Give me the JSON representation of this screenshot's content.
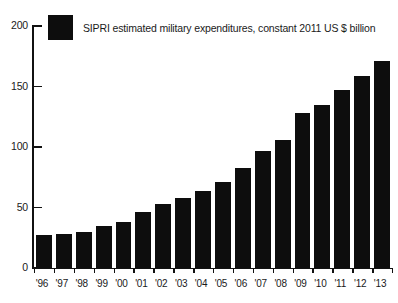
{
  "legend": {
    "label": "SIPRI estimated military expenditures, constant 2011 US $ billion",
    "swatch_color": "#0d0d0d"
  },
  "axis": {
    "y_ticks": [
      "0",
      "50",
      "100",
      "150",
      "200"
    ],
    "x_ticks": [
      "'96",
      "'97",
      "'98",
      "'99",
      "'00",
      "'01",
      "'02",
      "'03",
      "'04",
      "'05",
      "'06",
      "'07",
      "'08",
      "'09",
      "'10",
      "'11",
      "'12",
      "'13"
    ]
  },
  "chart_data": {
    "type": "bar",
    "title": "",
    "subtitle": "",
    "xlabel": "",
    "ylabel": "",
    "ylim": [
      0,
      200
    ],
    "grid": false,
    "legend_position": "top-left",
    "legend_entries": [
      "SIPRI estimated military expenditures, constant 2011 US $ billion"
    ],
    "bar_color": "#0d0d0d",
    "categories": [
      "'96",
      "'97",
      "'98",
      "'99",
      "'00",
      "'01",
      "'02",
      "'03",
      "'04",
      "'05",
      "'06",
      "'07",
      "'08",
      "'09",
      "'10",
      "'11",
      "'12",
      "'13"
    ],
    "values": [
      27,
      28,
      30,
      35,
      38,
      46,
      53,
      58,
      64,
      71,
      83,
      97,
      106,
      128,
      135,
      147,
      159,
      171
    ],
    "series": [
      {
        "name": "SIPRI estimated military expenditures, constant 2011 US $ billion",
        "values": [
          27,
          28,
          30,
          35,
          38,
          46,
          53,
          58,
          64,
          71,
          83,
          97,
          106,
          128,
          135,
          147,
          159,
          171
        ]
      }
    ]
  }
}
